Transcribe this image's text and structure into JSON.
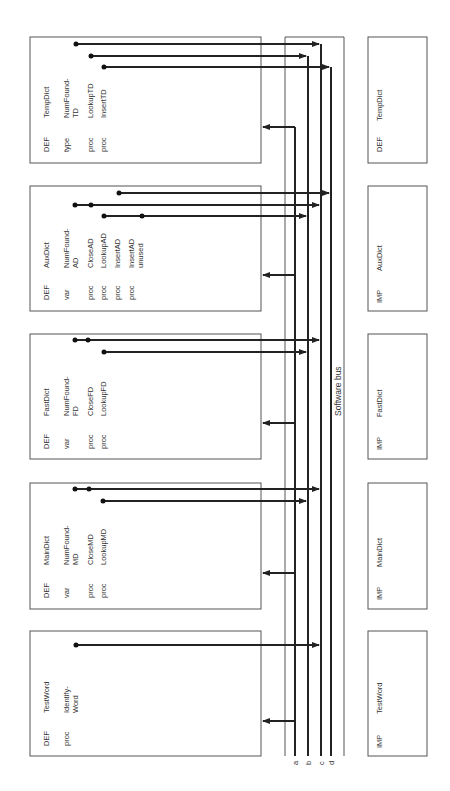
{
  "bus": {
    "label": "Software bus",
    "lines": [
      {
        "id": "a",
        "label": "a",
        "x": 295
      },
      {
        "id": "b",
        "label": "b",
        "x": 308
      },
      {
        "id": "c",
        "label": "c",
        "x": 321
      },
      {
        "id": "d",
        "label": "d",
        "x": 331
      }
    ]
  },
  "def_modules": [
    {
      "name": "TempDict",
      "keyword": "DEF",
      "entries": [
        {
          "kind": "type",
          "name": "NumFound-",
          "name2": "TD"
        },
        {
          "kind": "proc",
          "name": "LookupTD"
        },
        {
          "kind": "proc",
          "name": "InsertTD"
        }
      ]
    },
    {
      "name": "AuxDict",
      "keyword": "DEF",
      "entries": [
        {
          "kind": "var",
          "name": "NumFound-",
          "name2": "AD"
        },
        {
          "kind": "proc",
          "name": "CloseAD"
        },
        {
          "kind": "proc",
          "name": "LookupAD"
        },
        {
          "kind": "proc",
          "name": "InsertAD"
        },
        {
          "kind": "proc",
          "name": "InsertAD",
          "name2": "unused"
        }
      ]
    },
    {
      "name": "FastDict",
      "keyword": "DEF",
      "entries": [
        {
          "kind": "var",
          "name": "NumFound-",
          "name2": "FD"
        },
        {
          "kind": "proc",
          "name": "CloseFD"
        },
        {
          "kind": "proc",
          "name": "LookupFD"
        }
      ]
    },
    {
      "name": "MainDict",
      "keyword": "DEF",
      "entries": [
        {
          "kind": "var",
          "name": "NumFound-",
          "name2": "MD"
        },
        {
          "kind": "proc",
          "name": "CloseMD"
        },
        {
          "kind": "proc",
          "name": "LookupMD"
        }
      ]
    },
    {
      "name": "TestWord",
      "keyword": "DEF",
      "entries": [
        {
          "kind": "proc",
          "name": "Identify-",
          "name2": "Word"
        }
      ]
    }
  ],
  "imp_modules": [
    {
      "keyword": "DEF",
      "name": "TempDict"
    },
    {
      "keyword": "IMP",
      "name": "AuxDict"
    },
    {
      "keyword": "IMP",
      "name": "FastDict"
    },
    {
      "keyword": "IMP",
      "name": "MainDict"
    },
    {
      "keyword": "IMP",
      "name": "TestWord"
    }
  ]
}
